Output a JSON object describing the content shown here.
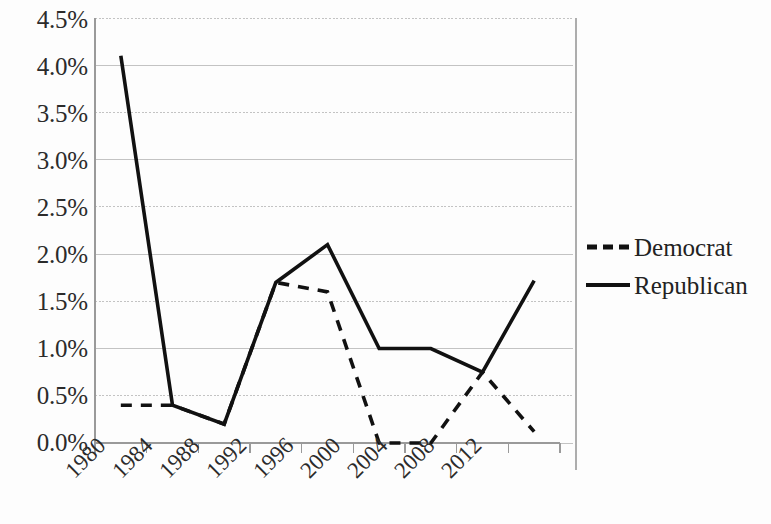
{
  "chart_data": {
    "type": "line",
    "title": "",
    "subtitle": "",
    "xlabel": "",
    "ylabel": "",
    "categories": [
      "1980",
      "1984",
      "1988",
      "1992",
      "1996",
      "2000",
      "2004",
      "2008",
      "2012"
    ],
    "ylim": [
      0.0,
      4.5
    ],
    "ytick_values": [
      0.0,
      0.5,
      1.0,
      1.5,
      2.0,
      2.5,
      3.0,
      3.5,
      4.0,
      4.5
    ],
    "ytick_labels": [
      "0.0%",
      "0.5%",
      "1.0%",
      "1.5%",
      "2.0%",
      "2.5%",
      "3.0%",
      "3.5%",
      "4.0%",
      "4.5%"
    ],
    "grid": true,
    "grid_axis": "y",
    "legend_position": "right",
    "series": [
      {
        "name": "Democrat",
        "style": "dashed",
        "color": "#111111",
        "values": [
          0.4,
          0.4,
          0.2,
          1.7,
          1.6,
          0.0,
          0.0,
          0.75,
          0.12
        ]
      },
      {
        "name": "Republican",
        "style": "solid",
        "color": "#111111",
        "values": [
          4.1,
          0.4,
          0.2,
          1.7,
          2.1,
          1.0,
          1.0,
          0.75,
          1.72
        ]
      }
    ]
  },
  "legend": {
    "items": [
      {
        "label": "Democrat",
        "marker": "dashed-line-swatch"
      },
      {
        "label": "Republican",
        "marker": "solid-line-swatch"
      }
    ]
  },
  "axes": {
    "y_tick_labels": [
      "4.5%",
      "4.0%",
      "3.5%",
      "3.0%",
      "2.5%",
      "2.0%",
      "1.5%",
      "1.0%",
      "0.5%",
      "0.0%"
    ],
    "x_tick_labels": [
      "1980",
      "1984",
      "1988",
      "1992",
      "1996",
      "2000",
      "2004",
      "2008",
      "2012"
    ]
  },
  "colors": {
    "line": "#111111",
    "grid": "#b9b9b9",
    "axis": "#9a9a9a",
    "text": "#2b2b2b",
    "background": "#ffffff"
  }
}
